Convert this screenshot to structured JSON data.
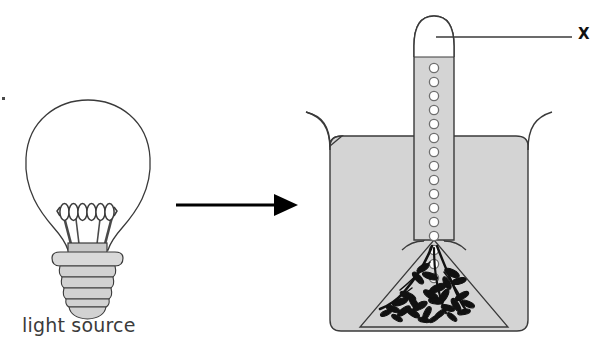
{
  "figure": {
    "type": "scientific-diagram",
    "background_color": "#ffffff"
  },
  "labels": {
    "light_source": "light source",
    "gas_collection": "X"
  },
  "colors": {
    "outline": "#3a3a3a",
    "liquid_fill": "#d4d4d4",
    "bulb_base_fill": "#c9c9c9",
    "plant_silhouette": "#111111",
    "arrow": "#000000",
    "bubble_fill": "#ffffff",
    "bubble_stroke": "#6e6e6e",
    "text_dark": "#3b3b3b",
    "text_label": "#111111"
  },
  "left_panel": {
    "name": "light-bulb-figure",
    "caption": "light source",
    "parts": [
      {
        "name": "glass-envelope",
        "shape": "pear"
      },
      {
        "name": "filament-coil",
        "loops": 6
      },
      {
        "name": "filament-support-wires",
        "count": 2
      },
      {
        "name": "stem-block",
        "shape": "rectangle"
      },
      {
        "name": "base-flange",
        "shape": "disc"
      },
      {
        "name": "screw-threads",
        "bands": 4
      },
      {
        "name": "base-tip",
        "shape": "rounded"
      }
    ]
  },
  "arrow": {
    "name": "process-arrow",
    "direction": "right",
    "x_start": 176,
    "x_end": 296,
    "y": 205
  },
  "right_panel": {
    "name": "beaker-funnel-assembly",
    "parts": [
      {
        "name": "beaker",
        "shape": "flared-rim-vessel",
        "filled": true
      },
      {
        "name": "water-fill",
        "color": "#d4d4d4"
      },
      {
        "name": "inverted-funnel",
        "shape": "cone-with-stem"
      },
      {
        "name": "test-tube",
        "shape": "rounded-top-tube",
        "contains": "collected gas"
      },
      {
        "name": "gas-space",
        "color": "#ffffff"
      },
      {
        "name": "bubble-column",
        "count": 16
      },
      {
        "name": "aquatic-plant",
        "color": "#111111"
      }
    ],
    "callout": {
      "label": "X",
      "points_to": "gas-space",
      "line_from_x": 436,
      "line_to_x": 572,
      "line_y": 37
    }
  },
  "bubbles": {
    "count": 16,
    "center_x": 434,
    "start_y": 68,
    "spacing": 14.4,
    "radius": 4.6
  }
}
